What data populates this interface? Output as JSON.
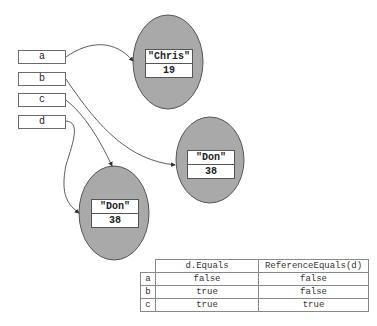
{
  "variables": [
    {
      "name": "a",
      "points_to": "chris"
    },
    {
      "name": "b",
      "points_to": "don_right"
    },
    {
      "name": "c",
      "points_to": "don_left"
    },
    {
      "name": "d",
      "points_to": "don_left"
    }
  ],
  "objects": {
    "chris": {
      "name": "\"Chris\"",
      "age": "19"
    },
    "don_right": {
      "name": "\"Don\"",
      "age": "38"
    },
    "don_left": {
      "name": "\"Don\"",
      "age": "38"
    }
  },
  "table": {
    "headers": [
      "",
      "d.Equals",
      "ReferenceEquals(d)"
    ],
    "rows": [
      {
        "label": "a",
        "equals": "false",
        "ref_equals": "false"
      },
      {
        "label": "b",
        "equals": "true",
        "ref_equals": "false"
      },
      {
        "label": "c",
        "equals": "true",
        "ref_equals": "true"
      }
    ]
  },
  "colors": {
    "ellipse_fill": "#a9a9a9",
    "stroke": "#444444"
  }
}
